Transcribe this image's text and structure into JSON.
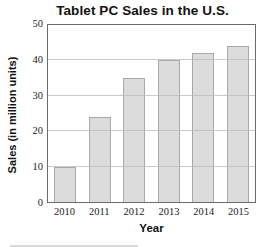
{
  "chart_data": {
    "type": "bar",
    "title": "Tablet PC Sales in the U.S.",
    "xlabel": "Year",
    "ylabel": "Sales (in million units)",
    "categories": [
      "2010",
      "2011",
      "2012",
      "2013",
      "2014",
      "2015"
    ],
    "values": [
      10,
      24,
      35,
      40,
      42,
      44
    ],
    "ylim": [
      0,
      50
    ],
    "yticks": [
      0,
      10,
      20,
      30,
      40,
      50
    ],
    "grid": "horizontal",
    "legend": "none",
    "colors": {
      "bar_fill": "#dcdcdc",
      "bar_border": "#a9a9a9",
      "frame": "#6b6b6b",
      "gridline": "#bdbdbd",
      "title_text": "#111111",
      "tick_text": "#1c1c1c"
    }
  }
}
